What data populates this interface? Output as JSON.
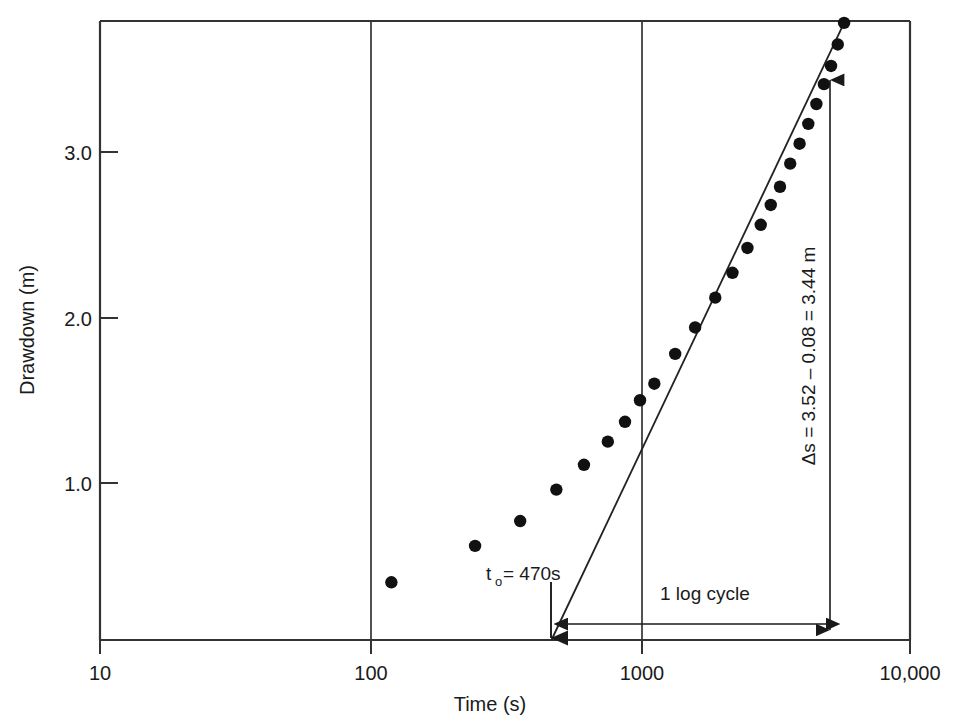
{
  "chart_data": {
    "type": "scatter",
    "title": "",
    "xlabel": "Time (s)",
    "ylabel": "Drawdown (m)",
    "x_scale": "log",
    "y_scale": "linear",
    "xlim": [
      10,
      10000
    ],
    "ylim": [
      0.0,
      3.78
    ],
    "grid": "vertical decade gridlines at 100 and 1000",
    "x_ticks": [
      "10",
      "100",
      "1000",
      "10,000"
    ],
    "x_tick_values": [
      10,
      100,
      1000,
      10000
    ],
    "y_ticks": [
      "1.0",
      "2.0",
      "3.0"
    ],
    "y_tick_values": [
      1.0,
      2.0,
      3.0
    ],
    "legend": "none",
    "series": [
      {
        "name": "Drawdown observations",
        "marker": "filled-circle",
        "color": "#111111",
        "points": [
          {
            "t": 120,
            "s": 0.4
          },
          {
            "t": 245,
            "s": 0.62
          },
          {
            "t": 360,
            "s": 0.77
          },
          {
            "t": 490,
            "s": 0.96
          },
          {
            "t": 620,
            "s": 1.11
          },
          {
            "t": 760,
            "s": 1.25
          },
          {
            "t": 880,
            "s": 1.37
          },
          {
            "t": 1000,
            "s": 1.5
          },
          {
            "t": 1130,
            "s": 1.6
          },
          {
            "t": 1350,
            "s": 1.78
          },
          {
            "t": 1600,
            "s": 1.94
          },
          {
            "t": 1900,
            "s": 2.12
          },
          {
            "t": 2200,
            "s": 2.27
          },
          {
            "t": 2500,
            "s": 2.42
          },
          {
            "t": 2800,
            "s": 2.56
          },
          {
            "t": 3050,
            "s": 2.68
          },
          {
            "t": 3300,
            "s": 2.79
          },
          {
            "t": 3600,
            "s": 2.93
          },
          {
            "t": 3900,
            "s": 3.05
          },
          {
            "t": 4200,
            "s": 3.17
          },
          {
            "t": 4500,
            "s": 3.29
          },
          {
            "t": 4800,
            "s": 3.41
          },
          {
            "t": 5100,
            "s": 3.52
          },
          {
            "t": 5400,
            "s": 3.65
          },
          {
            "t": 5700,
            "s": 3.78
          }
        ]
      }
    ],
    "fit_line": {
      "name": "Straight-line fit (Cooper-Jacob)",
      "x_intercept_t": 470,
      "points": [
        [
          470,
          0.0
        ],
        [
          5700,
          3.78
        ]
      ],
      "color": "#222222"
    },
    "annotations": [
      {
        "name": "t-zero",
        "text": "t",
        "sub": "o",
        "rest": " = 470s",
        "full": "t₀ = 470s",
        "at_t": 470
      },
      {
        "name": "delta-s",
        "text": "Δs = 3.52 – 0.08 = 3.44 m",
        "orientation": "vertical",
        "at_t": 4700
      },
      {
        "name": "one-log-cycle",
        "text": "1 log cycle",
        "from_t": 470,
        "to_t": 4700
      }
    ]
  },
  "axes": {
    "x_label": "Time (s)",
    "y_label": "Drawdown (m)",
    "x_tick_labels": [
      "10",
      "100",
      "1000",
      "10,000"
    ],
    "y_tick_labels": [
      "3.0",
      "2.0",
      "1.0"
    ]
  },
  "annotations": {
    "t_zero_base": "t",
    "t_zero_sub": "o",
    "t_zero_rest": " = 470s",
    "delta_s": "Δs = 3.52 – 0.08 = 3.44 m",
    "one_log_cycle": "1 log cycle"
  },
  "colors": {
    "axis": "#333333",
    "marker": "#111111",
    "fit_line": "#222222",
    "text": "#1a1a1a",
    "background": "#ffffff"
  }
}
